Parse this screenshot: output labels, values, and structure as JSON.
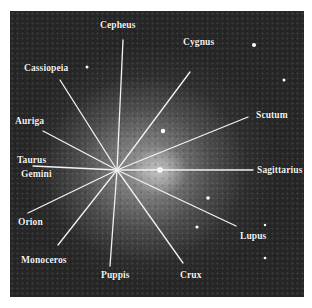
{
  "image": {
    "description": "Grayscale galaxy photograph with radial lines pointing to constellation names",
    "background_color": "#262626",
    "line_color": "#f2f2f2",
    "label_color": "#f4f4f4"
  },
  "center": {
    "x": 117,
    "y": 170
  },
  "labels": {
    "cepheus": "Cepheus",
    "cygnus": "Cygnus",
    "cassiopeia": "Cassiopeia",
    "auriga": "Auriga",
    "scutum": "Scutum",
    "taurus": "Taurus",
    "gemini": "Gemini",
    "sagittarius": "Sagittarius",
    "orion": "Orion",
    "lupus": "Lupus",
    "monoceros": "Monoceros",
    "puppis": "Puppis",
    "crux": "Crux"
  }
}
